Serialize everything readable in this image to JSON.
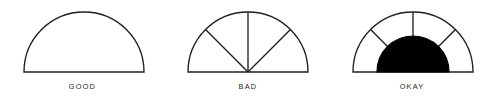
{
  "figure": {
    "background_color": "#ffffff",
    "stroke_color": "#231f20",
    "fill_color": "#000000",
    "width": 493,
    "height": 101,
    "diagrams": [
      {
        "id": "good",
        "label": "GOOD",
        "center_x": 84,
        "baseline_y": 72,
        "outer_radius": 60,
        "inner_radius": 0,
        "segments": 1,
        "filled_core": false,
        "spoke_angles": []
      },
      {
        "id": "bad",
        "label": "BAD",
        "center_x": 248,
        "baseline_y": 72,
        "outer_radius": 60,
        "inner_radius": 0,
        "segments": 4,
        "filled_core": false,
        "spoke_angles": [
          45,
          90,
          135
        ]
      },
      {
        "id": "okay",
        "label": "OKAY",
        "center_x": 413,
        "baseline_y": 72,
        "outer_radius": 60,
        "inner_radius": 36,
        "segments": 4,
        "filled_core": true,
        "spoke_angles": [
          45,
          90,
          135
        ]
      }
    ]
  }
}
